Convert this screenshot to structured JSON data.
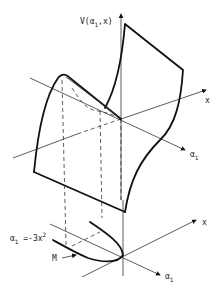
{
  "figure": {
    "upper_axes": {
      "vertical_label": "V(α₁,x)",
      "vertical_label_main": "V(α",
      "vertical_label_sub": "1",
      "vertical_label_tail": ",x)",
      "x_label": "x",
      "alpha_label_main": "α",
      "alpha_label_sub": "1"
    },
    "lower_axes": {
      "x_label": "x",
      "alpha_label_main": "α",
      "alpha_label_sub": "1"
    },
    "curve_label": {
      "full": "α₁ = -3x²",
      "main": "α",
      "sub": "1",
      "eq": " =-3x",
      "sup": "2"
    },
    "marker_label": "M",
    "colors": {
      "ink": "#111111",
      "background": "#ffffff"
    }
  }
}
